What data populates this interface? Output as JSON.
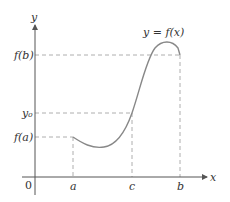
{
  "diagram": {
    "type": "function-graph",
    "colors": {
      "axis": "#555555",
      "curve": "#888888",
      "dashed": "#999999",
      "text": "#333333"
    },
    "axes": {
      "x_label": "x",
      "y_label": "y",
      "origin_label": "0"
    },
    "curve_label": "y = f(x)",
    "x_ticks": [
      {
        "label": "a"
      },
      {
        "label": "c"
      },
      {
        "label": "b"
      }
    ],
    "y_ticks": [
      {
        "label": "f(b)"
      },
      {
        "label": "y₀"
      },
      {
        "label": "f(a)"
      }
    ],
    "curve_points": [
      {
        "x": 73,
        "y": 137
      },
      {
        "x": 100,
        "y": 147
      },
      {
        "x": 132,
        "y": 113
      },
      {
        "x": 163,
        "y": 43
      },
      {
        "x": 180,
        "y": 55
      }
    ]
  }
}
